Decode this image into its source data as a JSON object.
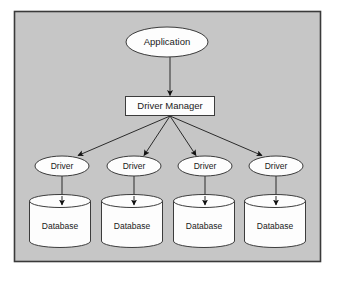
{
  "diagram": {
    "type": "hierarchy-flowchart",
    "canvas": {
      "width": 337,
      "height": 281
    },
    "colors": {
      "page_background": "#ffffff",
      "panel_fill": "#c6c6c6",
      "panel_border": "#3a3a3a",
      "node_fill": "#fdfdfd",
      "node_stroke": "#3c3c3c",
      "connector_stroke": "#2b2b2b",
      "arrowhead_fill": "#111111",
      "text_color": "#1a1a1a"
    },
    "panel": {
      "x": 14,
      "y": 11,
      "width": 307,
      "height": 251
    },
    "nodes": {
      "application": {
        "label": "Application",
        "shape": "ellipse",
        "cx": 167,
        "cy": 42,
        "rx": 41,
        "ry": 15
      },
      "driver_manager": {
        "label": "Driver Manager",
        "shape": "rectangle",
        "x": 125,
        "y": 96,
        "width": 90,
        "height": 20
      },
      "drivers": [
        {
          "label": "Driver",
          "shape": "ellipse",
          "cx": 62,
          "cy": 166,
          "rx": 27,
          "ry": 10
        },
        {
          "label": "Driver",
          "shape": "ellipse",
          "cx": 134,
          "cy": 166,
          "rx": 27,
          "ry": 10
        },
        {
          "label": "Driver",
          "shape": "ellipse",
          "cx": 205,
          "cy": 166,
          "rx": 27,
          "ry": 10
        },
        {
          "label": "Driver",
          "shape": "ellipse",
          "cx": 276,
          "cy": 166,
          "rx": 27,
          "ry": 10
        }
      ],
      "databases": [
        {
          "label": "Database",
          "shape": "cylinder",
          "x": 29,
          "y": 195,
          "width": 61,
          "height": 52
        },
        {
          "label": "Database",
          "shape": "cylinder",
          "x": 101,
          "y": 195,
          "width": 61,
          "height": 52
        },
        {
          "label": "Database",
          "shape": "cylinder",
          "x": 173,
          "y": 195,
          "width": 61,
          "height": 52
        },
        {
          "label": "Database",
          "shape": "cylinder",
          "x": 244,
          "y": 195,
          "width": 61,
          "height": 52
        }
      ]
    },
    "edges": [
      {
        "from": "application",
        "to": "driver_manager",
        "style": "straight-arrow"
      },
      {
        "from": "driver_manager",
        "to": "driver-1",
        "style": "straight-arrow"
      },
      {
        "from": "driver_manager",
        "to": "driver-2",
        "style": "straight-arrow"
      },
      {
        "from": "driver_manager",
        "to": "driver-3",
        "style": "straight-arrow"
      },
      {
        "from": "driver_manager",
        "to": "driver-4",
        "style": "straight-arrow"
      },
      {
        "from": "driver-1",
        "to": "database-1",
        "style": "straight-arrow"
      },
      {
        "from": "driver-2",
        "to": "database-2",
        "style": "straight-arrow"
      },
      {
        "from": "driver-3",
        "to": "database-3",
        "style": "straight-arrow"
      },
      {
        "from": "driver-4",
        "to": "database-4",
        "style": "straight-arrow"
      }
    ]
  }
}
